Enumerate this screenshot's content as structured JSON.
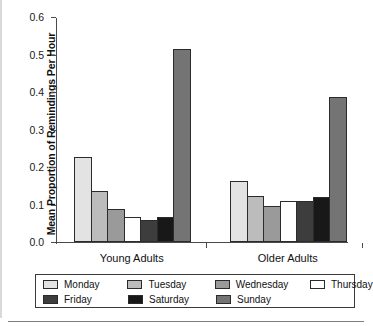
{
  "chart_data": {
    "type": "bar",
    "title": "",
    "xlabel": "",
    "ylabel": "Mean Proportion of Remindings Per Hour",
    "ylim": [
      0.0,
      0.6
    ],
    "ytick_labels": [
      "0.0",
      "0.1",
      "0.2",
      "0.3",
      "0.4",
      "0.5",
      "0.6"
    ],
    "ytick_values": [
      0.0,
      0.1,
      0.2,
      0.3,
      0.4,
      0.5,
      0.6
    ],
    "grid": false,
    "legend_position": "bottom",
    "categories": [
      "Young Adults",
      "Older Adults"
    ],
    "series": [
      {
        "name": "Monday",
        "color": "#e3e3e3",
        "values": [
          0.227,
          0.163
        ]
      },
      {
        "name": "Tuesday",
        "color": "#bcbcbc",
        "values": [
          0.135,
          0.122
        ]
      },
      {
        "name": "Wednesday",
        "color": "#9a9a9a",
        "values": [
          0.087,
          0.097
        ]
      },
      {
        "name": "Thursday",
        "color": "#ffffff",
        "values": [
          0.066,
          0.109
        ]
      },
      {
        "name": "Friday",
        "color": "#3d3d3d",
        "values": [
          0.059,
          0.11
        ]
      },
      {
        "name": "Saturday",
        "color": "#181818",
        "values": [
          0.067,
          0.119
        ]
      },
      {
        "name": "Sunday",
        "color": "#747474",
        "values": [
          0.515,
          0.387
        ]
      }
    ]
  },
  "legend": {
    "rows": [
      [
        "Monday",
        "Tuesday",
        "Wednesday",
        "Thursday"
      ],
      [
        "Friday",
        "Saturday",
        "Sunday"
      ]
    ]
  }
}
